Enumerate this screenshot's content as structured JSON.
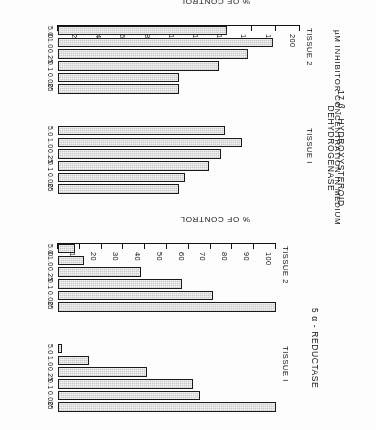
{
  "figure": {
    "rotation_note": "scan is upside-down",
    "x_axis_title": "µM INHIBITOR CONCENTRATION IN MEDIUM",
    "value_axis_title": "% OF CONTROL"
  },
  "panels": {
    "reductase": {
      "title_line1": "5 α - REDUCTASE",
      "groups": [
        {
          "label": "TISSUE I"
        },
        {
          "label": "TISSUE 2"
        }
      ]
    },
    "hsd": {
      "title_line1": "17 β - HYDROXYSTEROID",
      "title_line2": "DEHYDROGENASE",
      "groups": [
        {
          "label": "TISSUE I"
        },
        {
          "label": "TISSUE 2"
        }
      ]
    }
  },
  "chart_data": [
    {
      "type": "bar",
      "orientation": "horizontal",
      "title": "5 α - REDUCTASE",
      "xlabel": "µM INHIBITOR CONCENTRATION IN MEDIUM",
      "ylabel": "% OF CONTROL",
      "ylim": [
        0,
        100
      ],
      "yticks": [
        0,
        10,
        20,
        30,
        40,
        50,
        60,
        70,
        80,
        90,
        100
      ],
      "ytick_labels": [
        "0",
        "10",
        "20",
        "30",
        "40",
        "50",
        "60",
        "70",
        "80",
        "90",
        "100"
      ],
      "grid": false,
      "legend": "none",
      "categories": [
        "0",
        "0.025",
        "0.1",
        "0.25",
        "1.0",
        "5.0"
      ],
      "series": [
        {
          "name": "TISSUE I",
          "values": [
            100,
            65,
            62,
            41,
            14,
            2
          ]
        },
        {
          "name": "TISSUE 2",
          "values": [
            100,
            71,
            57,
            38,
            12,
            8
          ]
        }
      ]
    },
    {
      "type": "bar",
      "orientation": "horizontal",
      "title": "17 β - HYDROXYSTEROID DEHYDROGENASE",
      "xlabel": "µM INHIBITOR CONCENTRATION IN MEDIUM",
      "ylabel": "% OF CONTROL",
      "ylim": [
        0,
        200
      ],
      "yticks": [
        0,
        20,
        40,
        60,
        80,
        100,
        120,
        140,
        160,
        180,
        200
      ],
      "ytick_labels": [
        "0",
        "20",
        "40",
        "60",
        "80",
        "100",
        "120",
        "140",
        "160",
        "180",
        "200"
      ],
      "grid": false,
      "legend": "none",
      "categories": [
        "0",
        "0.025",
        "0.1",
        "0.25",
        "1.0",
        "5.0"
      ],
      "series": [
        {
          "name": "TISSUE I",
          "values": [
            100,
            105,
            125,
            135,
            152,
            138
          ]
        },
        {
          "name": "TISSUE 2",
          "values": [
            100,
            100,
            133,
            157,
            178,
            140
          ]
        }
      ]
    }
  ]
}
